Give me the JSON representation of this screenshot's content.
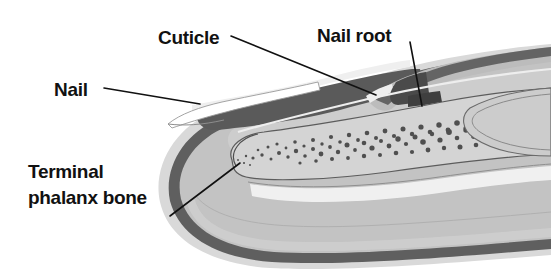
{
  "figure": {
    "background_color": "#ffffff",
    "width": 551,
    "height": 269
  },
  "labels": [
    {
      "id": "nail",
      "text": "Nail",
      "x": 54,
      "y": 90,
      "leader": "M 104,88 L 200,104",
      "points_to": "nail-plate"
    },
    {
      "id": "cuticle",
      "text": "Cuticle",
      "x": 158,
      "y": 39,
      "leader": "M 231,36 L 376,95",
      "points_to": "cuticle-fold"
    },
    {
      "id": "nail-root",
      "text": "Nail root",
      "x": 317,
      "y": 37,
      "leader": "M 410,42 L 422,106",
      "points_to": "nail-root-tip"
    },
    {
      "id": "terminal-phalanx-bone",
      "text": "Terminal\nphalanx bone",
      "line1": "Terminal",
      "line2": "phalanx bone",
      "x": 28,
      "y": 192,
      "leader": "M 170,216 L 240,163",
      "points_to": "phalanx-bone-tip"
    }
  ],
  "structures": [
    {
      "id": "nail-plate",
      "name": "nail plate",
      "tone": "#f2f2f2"
    },
    {
      "id": "nail-plate-edge",
      "name": "nail free edge",
      "tone": "#ffffff"
    },
    {
      "id": "cuticle-fold",
      "name": "cuticle / proximal nail fold",
      "tone": "#bdbdbd"
    },
    {
      "id": "nail-root-tip",
      "name": "nail root (matrix)",
      "tone": "#4a4a4a"
    },
    {
      "id": "nail-bed",
      "name": "nail bed",
      "tone": "#b8b8b8"
    },
    {
      "id": "dermis-band",
      "name": "dermis dark band",
      "tone": "#6b6b6b"
    },
    {
      "id": "epidermis-band",
      "name": "epidermis outer band",
      "tone": "#a8a8a8"
    },
    {
      "id": "subcutaneous-tissue",
      "name": "subcutaneous tissue",
      "tone": "#c6c6c6"
    },
    {
      "id": "phalanx-bone",
      "name": "terminal phalanx bone",
      "tone": "#d2d2d2"
    },
    {
      "id": "bone-marrow-stipple",
      "name": "bone trabecular stippling",
      "tone": "#5a5a5a"
    },
    {
      "id": "joint-capsule",
      "name": "joint at right edge",
      "tone": "#cccccc"
    },
    {
      "id": "tendon-band",
      "name": "flexor tendon band",
      "tone": "#f0f0f0"
    }
  ],
  "colors": {
    "background": "#ffffff",
    "label_text": "#111111",
    "leader_line": "#111111",
    "dark_band": "#5e5e5e",
    "mid_gray": "#b4b4b4",
    "light_gray": "#d8d8d8",
    "nail_white": "#f5f5f5",
    "stipple": "#4f4f4f"
  }
}
